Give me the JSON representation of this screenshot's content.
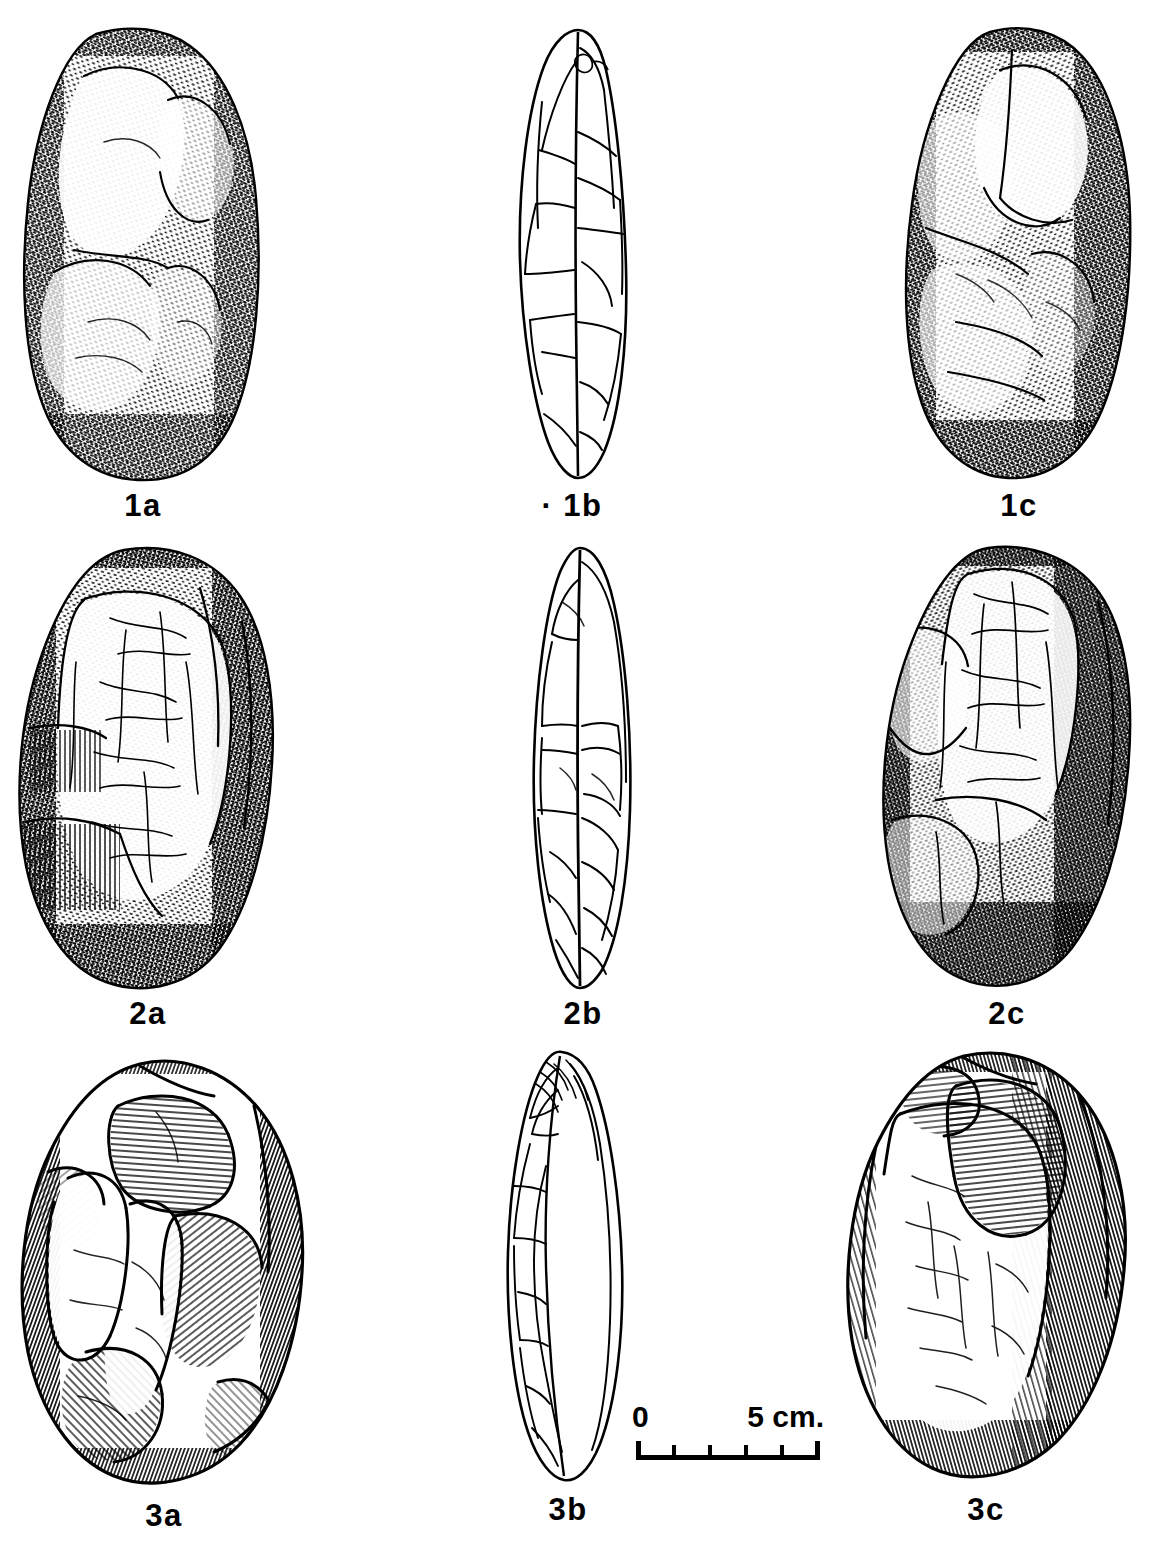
{
  "plate": {
    "kind": "archaeological-lithic-illustration",
    "technique": "pen-and-ink stipple and line drawing",
    "background_color": "#ffffff",
    "ink_color": "#000000",
    "grid": {
      "rows": 3,
      "columns": 3
    },
    "column_view_meaning": [
      "obverse face",
      "profile / edge view",
      "reverse face"
    ]
  },
  "figures": [
    {
      "id": "1a",
      "label": "1a",
      "artifact_number": 1,
      "view": "obverse face",
      "outline_shape": "elongated oval cobble, rounded ends",
      "rendering": "dense short-dash stipple shading, darkest along left and right margins and lower end",
      "notes": "large pale flake scar at upper right and a broad diagonal scar across the mid-body"
    },
    {
      "id": "1b",
      "label": "· 1b",
      "artifact_number": 1,
      "view": "profile / edge view",
      "outline_shape": "narrow pointed lens, tapering to a point at the lower end",
      "rendering": "pure outline, no shading, internal flake-scar ridge lines",
      "notes": "prominent central ridge running the full length"
    },
    {
      "id": "1c",
      "label": "1c",
      "artifact_number": 1,
      "view": "reverse face",
      "outline_shape": "elongated oval cobble, rounded ends",
      "rendering": "short-dash stipple shading, heaviest on the right margin and lower right",
      "notes": "pale flake scar upper centre-right, branching fracture lines lower half"
    },
    {
      "id": "2a",
      "label": "2a",
      "artifact_number": 2,
      "view": "obverse face",
      "outline_shape": "broad rounded oval",
      "rendering": "stipple with fine crackled reticulation over the pale central panel",
      "notes": "parallel line-hatched flake scars at left margin, crazed network in centre"
    },
    {
      "id": "2b",
      "label": "2b",
      "artifact_number": 2,
      "view": "profile / edge view",
      "outline_shape": "biconvex lens, widest at mid-length",
      "rendering": "pure outline with flake-scar lines",
      "notes": "strong central dividing ridge, scar facets on both flanks"
    },
    {
      "id": "2c",
      "label": "2c",
      "artifact_number": 2,
      "view": "reverse face",
      "outline_shape": "broad rounded oval",
      "rendering": "dense crackled stipple, very dark along right margin and base",
      "notes": "stepped flake scars along the left edge, heavy craquelure overall"
    },
    {
      "id": "3a",
      "label": "3a",
      "artifact_number": 3,
      "view": "obverse face",
      "outline_shape": "rounded ovoid, slightly shouldered at the top",
      "rendering": "bold line-hatching rather than stipple; ruled ripple lines inside flake scars",
      "notes": "large invasive flake removals; deep concave scar at upper centre"
    },
    {
      "id": "3b",
      "label": "3b",
      "artifact_number": 3,
      "view": "profile / edge view",
      "outline_shape": "asymmetric plano-convex lens",
      "rendering": "pure outline; dense scar lines on the left flank, smooth unworked curve on the right",
      "notes": "worked edge confined to one face"
    },
    {
      "id": "3c",
      "label": "3c",
      "artifact_number": 3,
      "view": "reverse face",
      "outline_shape": "rounded ovoid, irregular flaked top",
      "rendering": "line-hatched shading down the right margin and base, ruled ripples in the upper scar",
      "notes": "single large flake scar removed from the upper half"
    }
  ],
  "scale_bar": {
    "start_label": "0",
    "end_label": "5 cm.",
    "unit": "cm",
    "total_length_cm": 5,
    "major_divisions": 5,
    "tick_count": 6,
    "tick_values": [
      0,
      1,
      2,
      3,
      4,
      5
    ]
  }
}
